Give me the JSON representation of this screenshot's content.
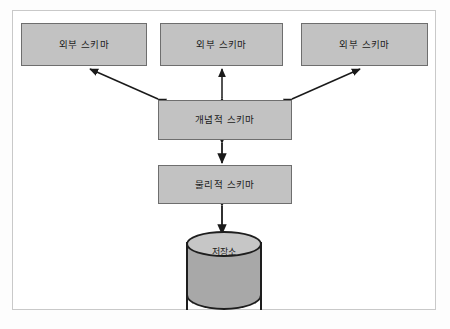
{
  "diagram": {
    "type": "layered-architecture",
    "background_color": "#fdfdfd",
    "frame_color": "#c9c9c9",
    "node_fill": "#c2c2c2",
    "node_stroke": "#6e6e6e",
    "arrow_color": "#1a1a1a",
    "nodes": [
      {
        "id": "ext1",
        "label": "외부 스키마",
        "shape": "rectangle",
        "level": "external"
      },
      {
        "id": "ext2",
        "label": "외부 스키마",
        "shape": "rectangle",
        "level": "external"
      },
      {
        "id": "ext3",
        "label": "외부 스키마",
        "shape": "rectangle",
        "level": "external"
      },
      {
        "id": "conceptual",
        "label": "개념적 스키마",
        "shape": "rectangle",
        "level": "conceptual"
      },
      {
        "id": "physical",
        "label": "물리적 스키마",
        "shape": "rectangle",
        "level": "physical"
      },
      {
        "id": "storage",
        "label": "저장소",
        "shape": "cylinder",
        "level": "storage"
      }
    ],
    "edges": [
      {
        "from": "conceptual",
        "to": "ext1",
        "style": "double-arrow",
        "orientation": "diagonal-left"
      },
      {
        "from": "conceptual",
        "to": "ext2",
        "style": "double-arrow",
        "orientation": "vertical"
      },
      {
        "from": "conceptual",
        "to": "ext3",
        "style": "double-arrow",
        "orientation": "diagonal-right"
      },
      {
        "from": "physical",
        "to": "conceptual",
        "style": "double-arrow",
        "orientation": "vertical"
      },
      {
        "from": "storage",
        "to": "physical",
        "style": "double-arrow",
        "orientation": "vertical"
      }
    ]
  }
}
